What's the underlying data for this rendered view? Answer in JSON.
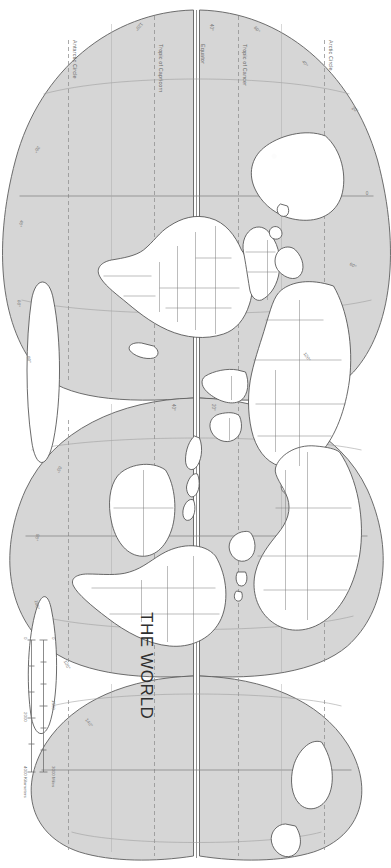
{
  "document": {
    "type": "map-sheet",
    "title": "THE WORLD",
    "orientation": "landscape sheet rotated 90 degrees clockwise",
    "projection": "interrupted equal-area (Goode homolosine style)"
  },
  "colors": {
    "ocean": "#d6d6d6",
    "land": "#ffffff",
    "coastline": "#4a4a4a",
    "border": "#6a6a6a",
    "graticule": "#8e8e8e",
    "dashed_graticule": "#8b8b8b",
    "text": "#5a5a5a",
    "page": "#ffffff"
  },
  "scale_bar": {
    "miles": {
      "unit_label": "3000 Miles",
      "ticks": [
        "0",
        "1500",
        "3000"
      ]
    },
    "kilometers": {
      "unit_label": "4000 Kilometers",
      "ticks": [
        "0",
        "2000",
        "4000"
      ]
    }
  },
  "latitude_lines": [
    {
      "id": "arctic-circle",
      "label": "Arctic Circle",
      "style": "dashed"
    },
    {
      "id": "tropic-cancer",
      "label": "Tropic of Cancer",
      "style": "dashed"
    },
    {
      "id": "equator",
      "label": "Equator",
      "style": "solid"
    },
    {
      "id": "tropic-capricorn",
      "label": "Tropic of Capricorn",
      "style": "dashed"
    },
    {
      "id": "antarctic-circle",
      "label": "Antarctic Circle",
      "style": "dashed"
    }
  ],
  "longitude_labels": [
    "0",
    "20",
    "40",
    "60",
    "80",
    "100",
    "120",
    "140",
    "160"
  ],
  "graticule_ticks": {
    "lat_degrees": [
      "0",
      "20",
      "40",
      "60",
      "80"
    ],
    "lon_degrees": [
      "0",
      "20",
      "40",
      "60",
      "80",
      "100",
      "120",
      "140",
      "160"
    ]
  },
  "map_labels": {
    "lon_top_0": "0",
    "lon_top_20": "20°",
    "lon_top_40": "40°",
    "lon_top_60": "60°",
    "lon_top_120": "120°",
    "lon_mid_20": "20°",
    "lon_mid_40": "40°",
    "lon_mid_60": "60°",
    "lon_mid_80": "80°",
    "lon_mid_100": "100°",
    "lon_mid_120": "120°",
    "lon_mid_140": "140°",
    "lon_bot_20": "20°",
    "lon_bot_40": "40°",
    "lon_bot_60": "60°",
    "lon_bot_80": "80°",
    "lon_left_40": "40°",
    "lon_left_60": "60°",
    "lon_left_120": "120°"
  }
}
